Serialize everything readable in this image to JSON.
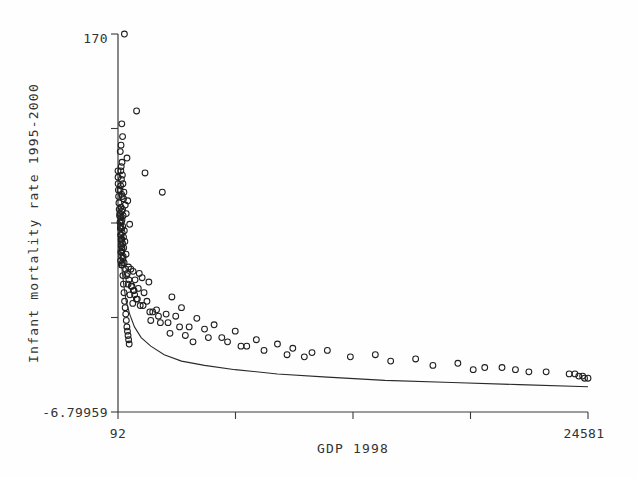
{
  "chart_data": {
    "type": "scatter",
    "title": "",
    "xlabel": "GDP 1998",
    "ylabel": "Infant mortality rate 1995-2000",
    "xlim": [
      92,
      24581
    ],
    "ylim": [
      -6.79959,
      170
    ],
    "xticklabels": [
      "92",
      "24581"
    ],
    "yticklabels": [
      "170",
      "-6.79959"
    ],
    "grid": false,
    "legend": null,
    "marker": "open-circle",
    "series": [
      {
        "name": "countries",
        "x": [
          425,
          1060,
          290,
          330,
          250,
          210,
          560,
          300,
          260,
          240,
          320,
          270,
          350,
          230,
          200,
          400,
          280,
          310,
          380,
          600,
          1500,
          470,
          250,
          330,
          290,
          520,
          360,
          240,
          300,
          260,
          700,
          340,
          280,
          420,
          310,
          250,
          380,
          290,
          450,
          330,
          260,
          390,
          300,
          240,
          510,
          280,
          350,
          230,
          320,
          270,
          2400,
          640,
          760,
          880,
          1200,
          540,
          1350,
          980,
          1700,
          620,
          820,
          1150,
          930,
          1450,
          710,
          2900,
          1050,
          1600,
          860,
          1250,
          3400,
          2100,
          1900,
          2600,
          3100,
          4200,
          1800,
          2300,
          5100,
          3800,
          4600,
          6200,
          2800,
          3600,
          5500,
          7300,
          4000,
          8400,
          6800,
          9200,
          11000,
          10200,
          13500,
          12200,
          15600,
          14300,
          17800,
          16500,
          19200,
          20800,
          22400,
          23600,
          24100,
          24400,
          24581,
          24300,
          23900,
          18600,
          21500,
          20100,
          9800,
          8900,
          7700,
          6500,
          5800,
          4800,
          3300,
          2700,
          2200,
          1750,
          1400,
          1100,
          960,
          890,
          780,
          660,
          580,
          490,
          410,
          360,
          300,
          265,
          235,
          215,
          195,
          175,
          155,
          140,
          125,
          110,
          100,
          95,
          92,
          185,
          225,
          255,
          285,
          315,
          345,
          375,
          405,
          435,
          465,
          495,
          525,
          555,
          585,
          615,
          645,
          675
        ],
        "y": [
          170,
          134,
          128,
          122,
          118,
          115,
          112,
          110,
          108,
          106,
          104,
          102,
          100,
          99,
          97,
          96,
          95,
          94,
          93,
          92,
          105,
          90,
          89,
          88,
          87,
          86,
          85,
          84,
          83,
          82,
          81,
          80,
          79,
          78,
          77,
          76,
          75,
          74,
          73,
          72,
          71,
          70,
          69,
          68,
          67,
          66,
          65,
          64,
          63,
          62,
          96,
          61,
          60,
          59,
          58,
          57,
          56,
          55,
          54,
          53,
          52,
          51,
          50,
          49,
          48,
          47,
          46,
          45,
          44,
          43,
          42,
          41,
          40,
          39,
          38,
          37,
          36,
          35,
          34,
          33,
          32,
          31,
          30,
          29,
          28,
          27,
          26,
          25,
          24,
          23,
          22,
          21,
          20,
          19,
          18,
          17,
          16,
          15,
          14,
          13,
          12,
          11,
          10,
          9,
          9,
          10,
          11,
          13,
          12,
          14,
          19,
          20,
          22,
          24,
          26,
          28,
          33,
          35,
          38,
          40,
          43,
          46,
          48,
          50,
          52,
          55,
          58,
          60,
          63,
          66,
          70,
          73,
          76,
          79,
          82,
          85,
          88,
          91,
          94,
          97,
          100,
          103,
          106,
          86,
          80,
          74,
          68,
          62,
          57,
          53,
          49,
          45,
          42,
          39,
          36,
          33,
          31,
          29,
          27,
          25
        ]
      }
    ],
    "fit_curve": {
      "name": "fitted power curve",
      "x": [
        140,
        180,
        230,
        300,
        400,
        520,
        700,
        950,
        1300,
        1800,
        2500,
        3400,
        4600,
        6200,
        8400,
        11000,
        14000,
        17500,
        21000,
        24581
      ],
      "y": [
        88,
        78,
        69,
        60,
        52,
        45,
        39,
        33,
        28,
        24,
        20,
        17,
        15,
        13,
        11,
        9.5,
        8,
        7,
        6,
        5
      ]
    }
  }
}
